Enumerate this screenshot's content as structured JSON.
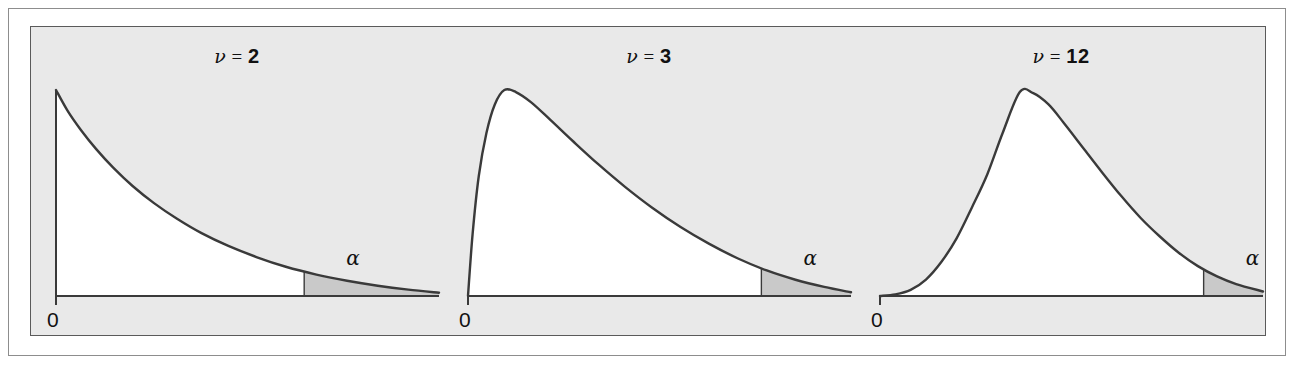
{
  "figure": {
    "background_color": "#ffffff",
    "panel_color": "#e9e9e9",
    "curve_area_color": "#ffffff",
    "tail_shade_color": "#c9c9c9",
    "line_color": "#3a3a3a",
    "border_color": "#5a5a5a"
  },
  "chart_data": {
    "type": "line",
    "title": "",
    "xlabel": "",
    "ylabel": "",
    "grid": false,
    "legend_position": "none",
    "panels": [
      {
        "id": "panel-nu-2",
        "nu_symbol": "ν",
        "equals": "=",
        "df": "2",
        "title_text": "ν = 2",
        "origin_label": "0",
        "tail_label": "α",
        "shape": "monotone-decreasing exponential",
        "peak_x": 0,
        "peak_y_rel": 1.0,
        "tail_start_x_rel": 0.648,
        "x_range": [
          0,
          1
        ],
        "y_range": [
          0,
          1
        ],
        "curve_points": [
          [
            0.0,
            1.0
          ],
          [
            0.03,
            0.9
          ],
          [
            0.065,
            0.806
          ],
          [
            0.105,
            0.713
          ],
          [
            0.15,
            0.622
          ],
          [
            0.2,
            0.534
          ],
          [
            0.255,
            0.452
          ],
          [
            0.315,
            0.376
          ],
          [
            0.38,
            0.305
          ],
          [
            0.45,
            0.243
          ],
          [
            0.525,
            0.188
          ],
          [
            0.6,
            0.142
          ],
          [
            0.68,
            0.104
          ],
          [
            0.76,
            0.074
          ],
          [
            0.84,
            0.05
          ],
          [
            0.92,
            0.031
          ],
          [
            1.0,
            0.016
          ]
        ]
      },
      {
        "id": "panel-nu-3",
        "nu_symbol": "ν",
        "equals": "=",
        "df": "3",
        "title_text": "ν = 3",
        "origin_label": "0",
        "tail_label": "α",
        "shape": "right-skewed unimodal",
        "peak_x": 0.095,
        "peak_y_rel": 1.0,
        "tail_start_x_rel": 0.766,
        "x_range": [
          0,
          1
        ],
        "y_range": [
          0,
          1
        ],
        "curve_points": [
          [
            0.0,
            0.0
          ],
          [
            0.012,
            0.3
          ],
          [
            0.028,
            0.58
          ],
          [
            0.048,
            0.79
          ],
          [
            0.07,
            0.93
          ],
          [
            0.095,
            1.0
          ],
          [
            0.125,
            0.99
          ],
          [
            0.165,
            0.94
          ],
          [
            0.215,
            0.855
          ],
          [
            0.275,
            0.75
          ],
          [
            0.34,
            0.64
          ],
          [
            0.41,
            0.53
          ],
          [
            0.48,
            0.43
          ],
          [
            0.555,
            0.335
          ],
          [
            0.63,
            0.253
          ],
          [
            0.705,
            0.182
          ],
          [
            0.78,
            0.124
          ],
          [
            0.855,
            0.079
          ],
          [
            0.93,
            0.044
          ],
          [
            1.0,
            0.018
          ]
        ]
      },
      {
        "id": "panel-nu-12",
        "nu_symbol": "ν",
        "equals": "=",
        "df": "12",
        "title_text": "ν = 12",
        "origin_label": "0",
        "tail_label": "α",
        "shape": "broad right-skewed unimodal",
        "peak_x": 0.365,
        "peak_y_rel": 1.0,
        "tail_start_x_rel": 0.845,
        "x_range": [
          0,
          1
        ],
        "y_range": [
          0,
          1
        ],
        "curve_points": [
          [
            0.0,
            0.0
          ],
          [
            0.04,
            0.008
          ],
          [
            0.08,
            0.03
          ],
          [
            0.12,
            0.08
          ],
          [
            0.16,
            0.165
          ],
          [
            0.2,
            0.28
          ],
          [
            0.24,
            0.43
          ],
          [
            0.28,
            0.59
          ],
          [
            0.32,
            0.79
          ],
          [
            0.365,
            0.99
          ],
          [
            0.4,
            0.985
          ],
          [
            0.44,
            0.93
          ],
          [
            0.48,
            0.84
          ],
          [
            0.53,
            0.72
          ],
          [
            0.58,
            0.6
          ],
          [
            0.63,
            0.485
          ],
          [
            0.68,
            0.38
          ],
          [
            0.73,
            0.29
          ],
          [
            0.78,
            0.21
          ],
          [
            0.83,
            0.145
          ],
          [
            0.88,
            0.095
          ],
          [
            0.93,
            0.058
          ],
          [
            1.0,
            0.022
          ]
        ]
      }
    ]
  }
}
